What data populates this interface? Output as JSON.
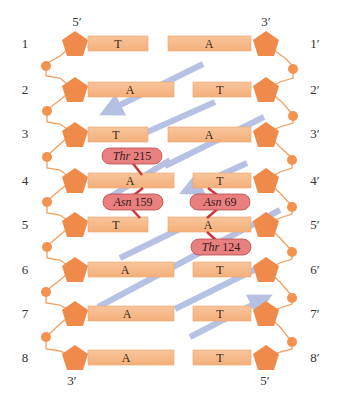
{
  "colors": {
    "sugar": "#f08a4b",
    "phosphate": "#f3934f",
    "backbone_line": "#f0a060",
    "bar": "#f6b98a",
    "bar_edge": "#efa36c",
    "arrow": "#a9b6de",
    "residue_fill": "#e98080",
    "residue_edge": "#b84a4a",
    "hbond": "#c9363c",
    "label": "#333333"
  },
  "strand_left": {
    "top_end": "5′",
    "bottom_end": "3′",
    "positions": [
      "1",
      "2",
      "3",
      "4",
      "5",
      "6",
      "7",
      "8"
    ]
  },
  "strand_right": {
    "top_end": "3′",
    "bottom_end": "5′",
    "positions": [
      "1′",
      "2′",
      "3′",
      "4′",
      "5′",
      "6′",
      "7′",
      "8′"
    ]
  },
  "base_pairs": [
    {
      "row": 1,
      "left": "T",
      "right": "A"
    },
    {
      "row": 2,
      "left": "A",
      "right": "T"
    },
    {
      "row": 3,
      "left": "T",
      "right": "A"
    },
    {
      "row": 4,
      "left": "A",
      "right": "T"
    },
    {
      "row": 5,
      "left": "T",
      "right": "A"
    },
    {
      "row": 6,
      "left": "A",
      "right": "T"
    },
    {
      "row": 7,
      "left": "A",
      "right": "T"
    },
    {
      "row": 8,
      "left": "A",
      "right": "T"
    }
  ],
  "residues": [
    {
      "name": "Thr",
      "number": "215",
      "contacts": "row 4 left base (A)"
    },
    {
      "name": "Asn",
      "number": "159",
      "contacts": "row 4 left A / row 5 left T"
    },
    {
      "name": "Asn",
      "number": "69",
      "contacts": "row 4 right T / row 5 right A"
    },
    {
      "name": "Thr",
      "number": "124",
      "contacts": "row 5 right base (A)"
    }
  ]
}
